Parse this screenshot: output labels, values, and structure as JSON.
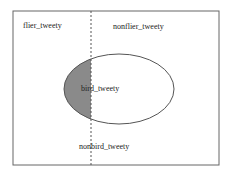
{
  "diagram": {
    "regions": {
      "flier": "flier_tweety",
      "nonflier": "nonflier_tweety",
      "bird": "bird_tweety",
      "nonbird": "nonbird_tweety"
    },
    "colors": {
      "border": "#555555",
      "shaded": "#8a8a8a",
      "background": "#ffffff"
    }
  }
}
